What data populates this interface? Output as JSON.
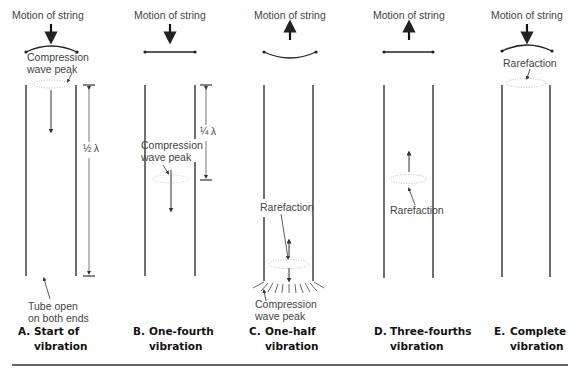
{
  "figure": {
    "panels": [
      {
        "id": "A",
        "motion_label": "Motion of string",
        "string_direction": "down",
        "string_shape": "curved-down",
        "annotations": [
          "Compression wave peak",
          "Tube open on both ends"
        ],
        "annotation_lines": {
          "compression_1": "Compression",
          "compression_2": "wave peak",
          "tube_1": "Tube open",
          "tube_2": "on both ends"
        },
        "dimension": "½ λ",
        "caption_letter": "A.",
        "caption_line1": "Start of",
        "caption_line2": "vibration"
      },
      {
        "id": "B",
        "motion_label": "Motion of string",
        "string_direction": "down",
        "string_shape": "straight",
        "annotation_lines": {
          "compression_1": "Compression",
          "compression_2": "wave peak"
        },
        "dimension": "¼ λ",
        "caption_letter": "B.",
        "caption_line1": "One-fourth",
        "caption_line2": "vibration"
      },
      {
        "id": "C",
        "motion_label": "Motion of string",
        "string_direction": "up",
        "string_shape": "curved-up",
        "annotation_lines": {
          "rarefaction": "Rarefaction",
          "compression_1": "Compression",
          "compression_2": "wave peak"
        },
        "caption_letter": "C.",
        "caption_line1": "One-half",
        "caption_line2": "vibration"
      },
      {
        "id": "D",
        "motion_label": "Motion of string",
        "string_direction": "up",
        "string_shape": "straight",
        "annotation_lines": {
          "rarefaction": "Rarefaction"
        },
        "caption_letter": "D.",
        "caption_line1": "Three-fourths",
        "caption_line2": "vibration"
      },
      {
        "id": "E",
        "motion_label": "Motion of string",
        "string_direction": "down",
        "string_shape": "curved-down",
        "annotation_lines": {
          "rarefaction": "Rarefaction"
        },
        "caption_letter": "E.",
        "caption_line1": "Complete",
        "caption_line2": "vibration"
      }
    ],
    "colors": {
      "line": "#222222",
      "text": "#444444",
      "caption": "#111111",
      "dotted": "#aaaaaa"
    }
  }
}
